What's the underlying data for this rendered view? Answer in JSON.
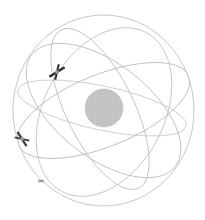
{
  "figure": {
    "name": "orbital-constellation-sphere",
    "background_color": "#ffffff",
    "width": 205,
    "height": 220,
    "title": "",
    "caption": ""
  },
  "sphere": {
    "name": "outer-sphere-wireframe",
    "center_x": 103.5,
    "center_y": 110.5,
    "radius_x": 90.5,
    "radius_y": 95.5,
    "stroke_color": "#b9b9bd",
    "stroke_width": 0.8,
    "fill": "none"
  },
  "core": {
    "name": "central-body",
    "label": "",
    "center_x": 104,
    "center_y": 108,
    "radius": 19,
    "fill_color": "#c8c8c8",
    "dot_color": "#a8a8a8",
    "stroke_color": "#bdbdbd",
    "texture": "stippled"
  },
  "orbits": [
    {
      "id": "orbit-1",
      "label": "orbit-plane-1",
      "cx": 103.5,
      "cy": 110.5,
      "rx": 92,
      "ry": 36,
      "rotation": -22,
      "stroke_color": "#b5b5ba",
      "stroke_width": 0.75
    },
    {
      "id": "orbit-2",
      "label": "orbit-plane-2",
      "cx": 103.5,
      "cy": 110.5,
      "rx": 91,
      "ry": 47,
      "rotation": 38,
      "stroke_color": "#b5b5ba",
      "stroke_width": 0.75
    },
    {
      "id": "orbit-3",
      "label": "orbit-plane-3",
      "cx": 100,
      "cy": 109,
      "rx": 88,
      "ry": 34,
      "rotation": 64,
      "stroke_color": "#b8b8bc",
      "stroke_width": 0.75
    },
    {
      "id": "orbit-4",
      "label": "orbit-plane-4",
      "cx": 104,
      "cy": 112,
      "rx": 90,
      "ry": 60,
      "rotation": -62,
      "stroke_color": "#bcbcc0",
      "stroke_width": 0.75
    },
    {
      "id": "orbit-5",
      "label": "orbit-plane-5",
      "cx": 102,
      "cy": 108,
      "rx": 86,
      "ry": 22,
      "rotation": 12,
      "stroke_color": "#bfbfc3",
      "stroke_width": 0.7
    }
  ],
  "satellites": [
    {
      "id": "satellite-1",
      "label": "satellite-upper-left",
      "x": 57,
      "y": 72,
      "size": 18,
      "rotation": -32,
      "body_color": "#2b2b33",
      "hub_color": "#9a9aa0"
    },
    {
      "id": "satellite-2",
      "label": "satellite-lower-left",
      "x": 22,
      "y": 139,
      "size": 17,
      "rotation": 58,
      "body_color": "#3a3a42",
      "hub_color": "#a0a0a6"
    },
    {
      "id": "satellite-3",
      "label": "satellite-bottom",
      "x": 41,
      "y": 181,
      "size": 7,
      "rotation": 20,
      "body_color": "#9d9da3",
      "hub_color": "#8e8e95"
    }
  ]
}
